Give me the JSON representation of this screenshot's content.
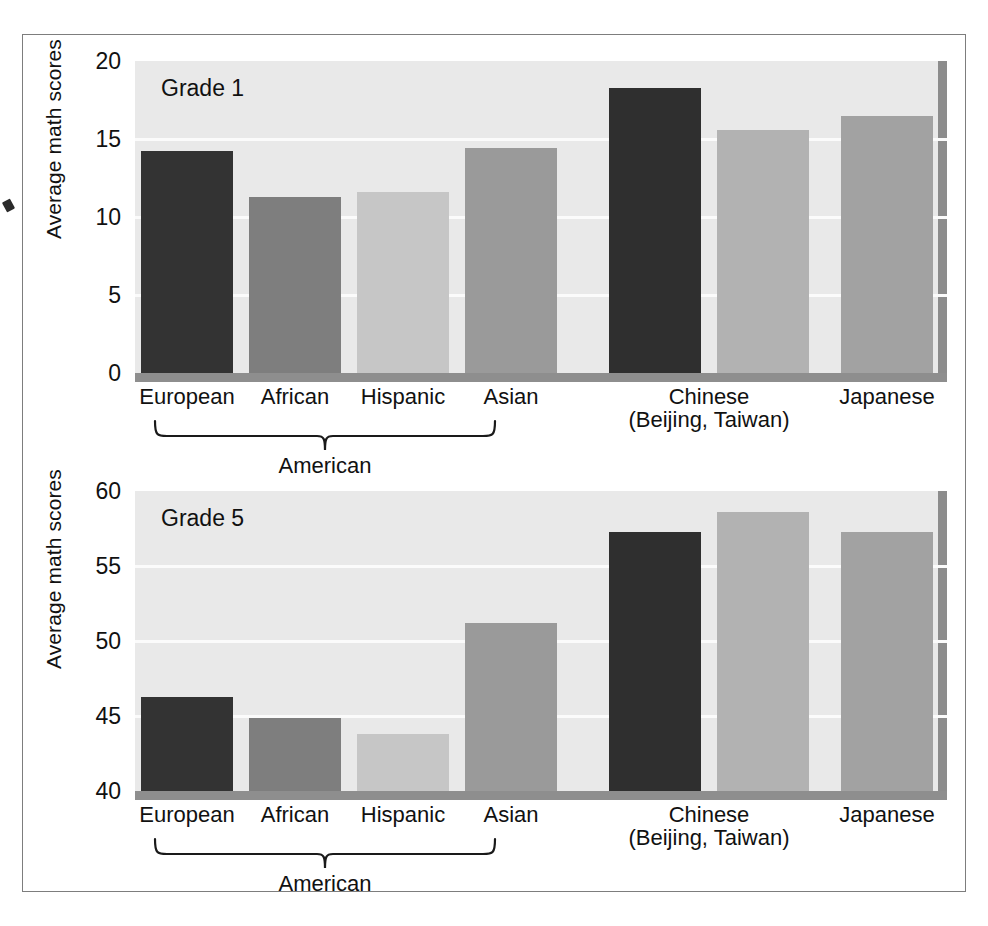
{
  "figure": {
    "background_color": "#ffffff",
    "frame_color": "#7d7d7d",
    "plot_background": "#e9e9e9",
    "gridline_color": "#fbfbfb",
    "baseline_color": "#8e8e8e"
  },
  "chart_data": [
    {
      "type": "bar",
      "title": "Grade 1",
      "xlabel": "",
      "ylabel": "Average math scores",
      "ylim": [
        0,
        20
      ],
      "yticks": [
        0,
        5,
        10,
        15,
        20
      ],
      "ytick_labels": [
        "0",
        "5",
        "10",
        "15",
        "20"
      ],
      "grid": true,
      "legend": "none",
      "categories": [
        "European",
        "African",
        "Hispanic",
        "Asian",
        "Chinese",
        "Chinese",
        "Japanese"
      ],
      "values": [
        14.2,
        11.3,
        11.6,
        14.4,
        18.3,
        15.6,
        16.5
      ],
      "bar_colors": [
        "#333333",
        "#7e7e7e",
        "#c6c6c6",
        "#9a9a9a",
        "#2f2f2f",
        "#b2b2b2",
        "#a2a2a2"
      ],
      "group_brace": {
        "label": "American",
        "covers": [
          "European",
          "African",
          "Hispanic",
          "Asian"
        ]
      },
      "annotations": [
        "Chinese (Beijing, Taiwan)",
        "Japanese"
      ]
    },
    {
      "type": "bar",
      "title": "Grade 5",
      "xlabel": "",
      "ylabel": "Average math scores",
      "ylim": [
        40,
        60
      ],
      "yticks": [
        40,
        45,
        50,
        55,
        60
      ],
      "ytick_labels": [
        "40",
        "45",
        "50",
        "55",
        "60"
      ],
      "grid": true,
      "legend": "none",
      "categories": [
        "European",
        "African",
        "Hispanic",
        "Asian",
        "Chinese",
        "Chinese",
        "Japanese"
      ],
      "values": [
        46.3,
        44.9,
        43.8,
        51.2,
        57.3,
        58.6,
        57.3
      ],
      "bar_colors": [
        "#333333",
        "#7e7e7e",
        "#c6c6c6",
        "#9a9a9a",
        "#2f2f2f",
        "#b2b2b2",
        "#a2a2a2"
      ],
      "group_brace": {
        "label": "American",
        "covers": [
          "European",
          "African",
          "Hispanic",
          "Asian"
        ]
      },
      "annotations": [
        "Chinese (Beijing, Taiwan)",
        "Japanese"
      ]
    }
  ],
  "grade1": {
    "caption": "Grade 1",
    "axis_title": "Average math scores",
    "ticks": [
      {
        "label": "20"
      },
      {
        "label": "15"
      },
      {
        "label": "10"
      },
      {
        "label": "5"
      },
      {
        "label": "0"
      }
    ],
    "categories": [
      {
        "label": "European",
        "sub": ""
      },
      {
        "label": "African",
        "sub": ""
      },
      {
        "label": "Hispanic",
        "sub": ""
      },
      {
        "label": "Asian",
        "sub": ""
      },
      {
        "label": "Chinese",
        "sub": "(Beijing, Taiwan)"
      },
      {
        "label": "Japanese",
        "sub": ""
      }
    ],
    "brace_label": "American"
  },
  "grade5": {
    "caption": "Grade 5",
    "axis_title": "Average math scores",
    "ticks": [
      {
        "label": "60"
      },
      {
        "label": "55"
      },
      {
        "label": "50"
      },
      {
        "label": "45"
      },
      {
        "label": "40"
      }
    ],
    "categories": [
      {
        "label": "European",
        "sub": ""
      },
      {
        "label": "African",
        "sub": ""
      },
      {
        "label": "Hispanic",
        "sub": ""
      },
      {
        "label": "Asian",
        "sub": ""
      },
      {
        "label": "Chinese",
        "sub": "(Beijing, Taiwan)"
      },
      {
        "label": "Japanese",
        "sub": ""
      }
    ],
    "brace_label": "American"
  }
}
